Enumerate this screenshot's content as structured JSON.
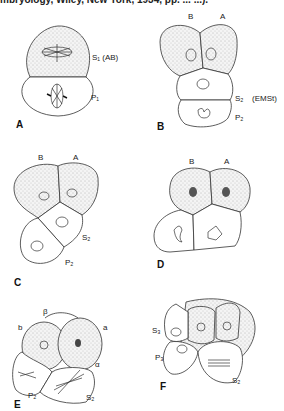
{
  "header": {
    "citation_fragment": "mbryology, Wiley, New York, 1934, pp. ... ...)."
  },
  "panels": [
    {
      "id": "A",
      "labels": [
        "S₁ (AB)",
        "P₁"
      ]
    },
    {
      "id": "B",
      "labels": [
        "B",
        "A",
        "S₂",
        "(EMSt)",
        "P₂"
      ]
    },
    {
      "id": "C",
      "labels": [
        "B",
        "A",
        "S₂",
        "P₂"
      ]
    },
    {
      "id": "D",
      "labels": [
        "B",
        "A"
      ]
    },
    {
      "id": "E",
      "labels": [
        "β",
        "b",
        "a",
        "α",
        "P₂",
        "S₂"
      ]
    },
    {
      "id": "F",
      "labels": [
        "S₃",
        "P₃",
        "S₂"
      ]
    }
  ]
}
